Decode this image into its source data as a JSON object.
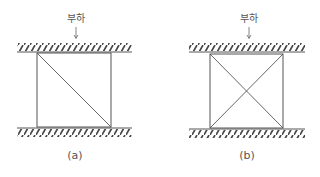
{
  "panels": [
    {
      "id": "a",
      "load_label": "부하",
      "caption": "(a)",
      "diagonals": [
        "top-left-to-bottom-right"
      ]
    },
    {
      "id": "b",
      "load_label": "부하",
      "caption": "(b)",
      "diagonals": [
        "top-left-to-bottom-right",
        "top-right-to-bottom-left"
      ]
    }
  ],
  "colors": {
    "line": "#555555",
    "hatch": "#444444"
  }
}
